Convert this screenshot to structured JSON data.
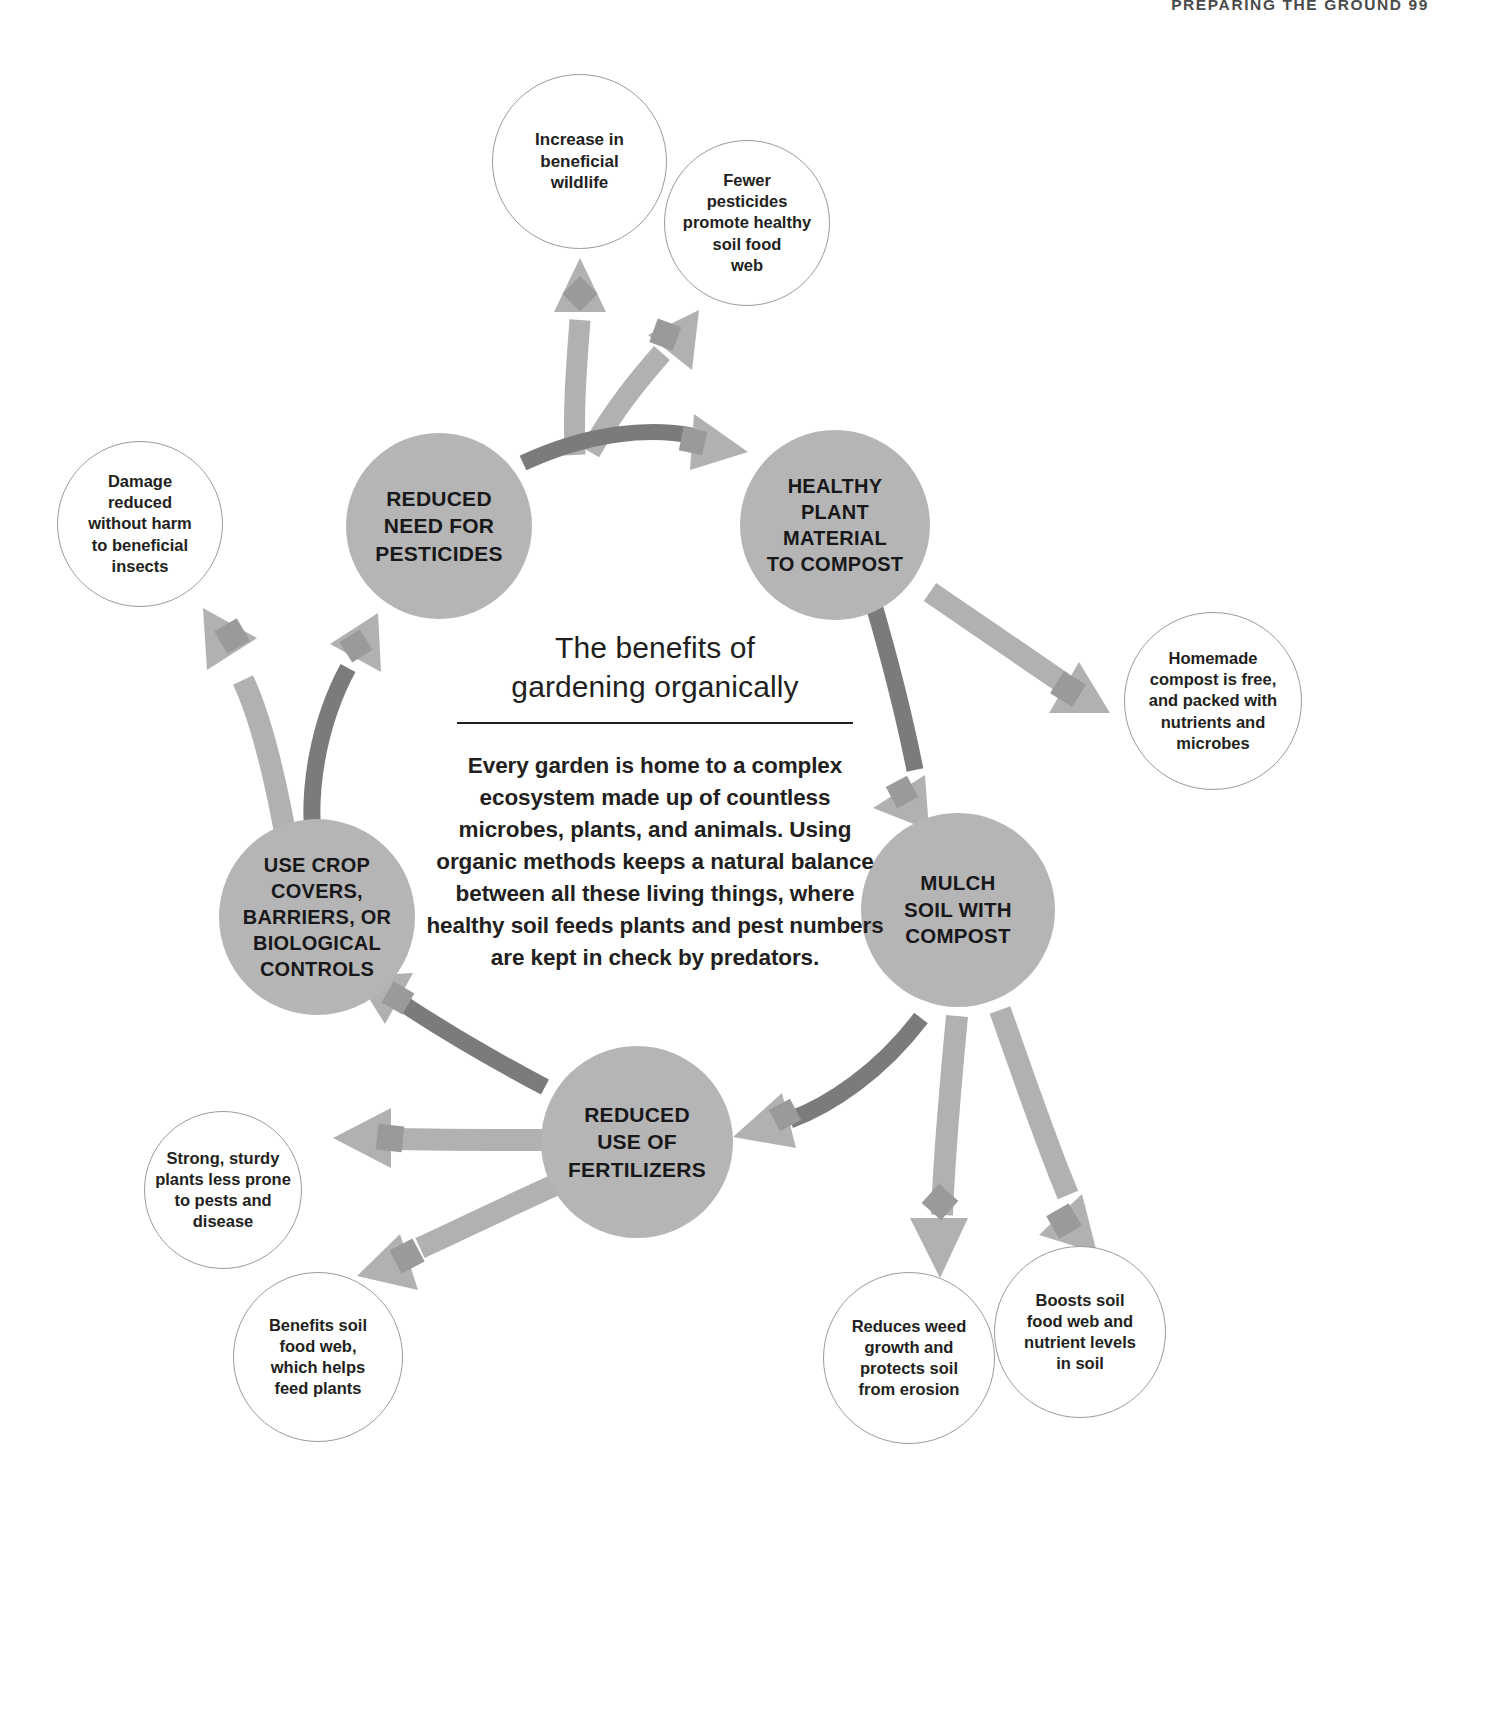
{
  "running_head": "PREPARING THE GROUND  99",
  "center": {
    "title": "The benefits of\ngardening organically",
    "body": "Every garden is home to a complex ecosystem made up of countless microbes, plants, and animals. Using organic methods keeps a natural balance between all these living things, where healthy soil feeds plants and pest numbers are kept in check by predators."
  },
  "colors": {
    "hub_fill": "#b5b5b5",
    "satellite_fill": "#ffffff",
    "satellite_stroke": "#9b9b9b",
    "arrow_light": "#b1b1b1",
    "arrow_dark": "#7b7b7b",
    "text": "#231f20",
    "page_background": "#ffffff"
  },
  "chart_data": {
    "type": "diagram",
    "layout": "cycle",
    "hubs": [
      {
        "id": "reduced-pesticides",
        "label": "REDUCED\nNEED FOR\nPESTICIDES"
      },
      {
        "id": "healthy-plant-material",
        "label": "HEALTHY\nPLANT MATERIAL\nTO COMPOST"
      },
      {
        "id": "mulch-soil",
        "label": "MULCH\nSOIL WITH\nCOMPOST"
      },
      {
        "id": "reduced-fertilizers",
        "label": "REDUCED\nUSE OF\nFERTILIZERS"
      },
      {
        "id": "crop-covers",
        "label": "USE CROP\nCOVERS,\nBARRIERS, OR\nBIOLOGICAL\nCONTROLS"
      }
    ],
    "cycle_edges": [
      {
        "from": "reduced-pesticides",
        "to": "healthy-plant-material"
      },
      {
        "from": "healthy-plant-material",
        "to": "mulch-soil"
      },
      {
        "from": "mulch-soil",
        "to": "reduced-fertilizers"
      },
      {
        "from": "reduced-fertilizers",
        "to": "crop-covers"
      },
      {
        "from": "crop-covers",
        "to": "reduced-pesticides"
      }
    ],
    "satellites": [
      {
        "id": "increase-wildlife",
        "label": "Increase in\nbeneficial\nwildlife",
        "from": "reduced-pesticides"
      },
      {
        "id": "fewer-pesticides",
        "label": "Fewer\npesticides\npromote healthy\nsoil food\nweb",
        "from": "reduced-pesticides"
      },
      {
        "id": "homemade-compost",
        "label": "Homemade\ncompost is free,\nand packed with\nnutrients and\nmicrobes",
        "from": "healthy-plant-material"
      },
      {
        "id": "boosts-soil",
        "label": "Boosts soil\nfood web and\nnutrient levels\nin soil",
        "from": "mulch-soil"
      },
      {
        "id": "reduces-weed",
        "label": "Reduces weed\ngrowth and\nprotects soil\nfrom erosion",
        "from": "mulch-soil"
      },
      {
        "id": "benefits-soil-web",
        "label": "Benefits soil\nfood web,\nwhich helps\nfeed plants",
        "from": "reduced-fertilizers"
      },
      {
        "id": "strong-sturdy",
        "label": "Strong, sturdy\nplants less prone\nto pests and\ndisease",
        "from": "reduced-fertilizers"
      },
      {
        "id": "damage-reduced",
        "label": "Damage\nreduced\nwithout harm\nto beneficial\ninsects",
        "from": "crop-covers"
      }
    ]
  },
  "hubs": {
    "reduced_pesticides": "REDUCED\nNEED FOR\nPESTICIDES",
    "healthy_plant_material": "HEALTHY\nPLANT MATERIAL\nTO COMPOST",
    "mulch_soil": "MULCH\nSOIL WITH\nCOMPOST",
    "reduced_fertilizers": "REDUCED\nUSE OF\nFERTILIZERS",
    "crop_covers": "USE CROP\nCOVERS,\nBARRIERS, OR\nBIOLOGICAL\nCONTROLS"
  },
  "satellites": {
    "increase_wildlife": "Increase in\nbeneficial\nwildlife",
    "fewer_pesticides": "Fewer\npesticides\npromote healthy\nsoil food\nweb",
    "homemade_compost": "Homemade\ncompost is free,\nand packed with\nnutrients and\nmicrobes",
    "boosts_soil": "Boosts soil\nfood web and\nnutrient levels\nin soil",
    "reduces_weed": "Reduces weed\ngrowth and\nprotects soil\nfrom erosion",
    "benefits_soil_web": "Benefits soil\nfood web,\nwhich helps\nfeed plants",
    "strong_sturdy": "Strong, sturdy\nplants less prone\nto pests and\ndisease",
    "damage_reduced": "Damage\nreduced\nwithout harm\nto beneficial\ninsects"
  }
}
